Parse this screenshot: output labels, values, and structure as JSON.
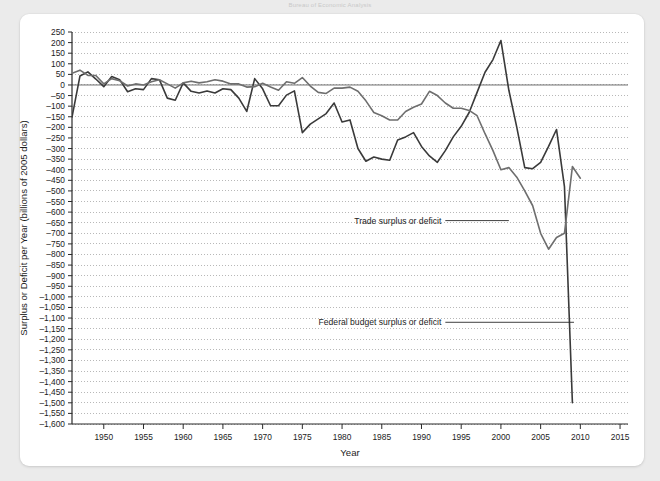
{
  "page": {
    "top_caption": "Bureau of Economic Analysis",
    "background_color": "#ebebeb",
    "card_color": "#ffffff"
  },
  "chart_data": {
    "type": "line",
    "title": "",
    "xlabel": "Year",
    "ylabel": "Surplus or Deficit per Year (billions of 2005 dollars)",
    "xlim": [
      1946,
      2016
    ],
    "ylim": [
      -1600,
      250
    ],
    "grid": true,
    "grid_style": "dotted-horizontal",
    "legend_position": "inline-annotation",
    "xticks": [
      1950,
      1955,
      1960,
      1965,
      1970,
      1975,
      1980,
      1985,
      1990,
      1995,
      2000,
      2005,
      2010,
      2015
    ],
    "xtick_labels": [
      "1950",
      "1955",
      "1960",
      "1965",
      "1970",
      "1975",
      "1980",
      "1985",
      "1990",
      "1995",
      "2000",
      "2005",
      "2010",
      "2015"
    ],
    "yticks": [
      250,
      200,
      150,
      100,
      50,
      0,
      -50,
      -100,
      -150,
      -200,
      -250,
      -300,
      -350,
      -400,
      -450,
      -500,
      -550,
      -600,
      -650,
      -700,
      -750,
      -800,
      -850,
      -900,
      -950,
      -1000,
      -1050,
      -1100,
      -1150,
      -1200,
      -1250,
      -1300,
      -1350,
      -1400,
      -1450,
      -1500,
      -1550,
      -1600
    ],
    "ytick_labels": [
      "250",
      "200",
      "150",
      "100",
      "50",
      "0",
      "–50",
      "–100",
      "–150",
      "–200",
      "–250",
      "–300",
      "–350",
      "–400",
      "–450",
      "–500",
      "–550",
      "–600",
      "–650",
      "–700",
      "–750",
      "–800",
      "–850",
      "–900",
      "–950",
      "–1,000",
      "–1,050",
      "–1,100",
      "–1,150",
      "–1,200",
      "–1,250",
      "–1,300",
      "–1,350",
      "–1,400",
      "–1,450",
      "–1,500",
      "–1,550",
      "–1,600"
    ],
    "annotations": [
      {
        "text": "Trade surplus or deficit",
        "x": 1992.5,
        "y": -640,
        "leader_to_x": 2001.0
      },
      {
        "text": "Federal budget surplus or deficit",
        "x": 1992.5,
        "y": -1120,
        "leader_to_x": 2009.2
      }
    ],
    "series": [
      {
        "name": "Federal budget surplus or deficit",
        "color": "#3a3a3a",
        "width": 1.6,
        "x": [
          1946,
          1947,
          1948,
          1949,
          1950,
          1951,
          1952,
          1953,
          1954,
          1955,
          1956,
          1957,
          1958,
          1959,
          1960,
          1961,
          1962,
          1963,
          1964,
          1965,
          1966,
          1967,
          1968,
          1969,
          1970,
          1971,
          1972,
          1973,
          1974,
          1975,
          1976,
          1977,
          1978,
          1979,
          1980,
          1981,
          1982,
          1983,
          1984,
          1985,
          1986,
          1987,
          1988,
          1989,
          1990,
          1991,
          1992,
          1993,
          1994,
          1995,
          1996,
          1997,
          1998,
          1999,
          2000,
          2001,
          2002,
          2003,
          2004,
          2005,
          2006,
          2007,
          2008,
          2009
        ],
        "values": [
          -152,
          42,
          62,
          28,
          -8,
          40,
          25,
          -32,
          -18,
          -22,
          30,
          25,
          -62,
          -72,
          10,
          -30,
          -38,
          -28,
          -38,
          -18,
          -22,
          -62,
          -125,
          30,
          -18,
          -98,
          -98,
          -48,
          -28,
          -225,
          -185,
          -160,
          -135,
          -85,
          -175,
          -165,
          -300,
          -360,
          -340,
          -350,
          -355,
          -260,
          -245,
          -225,
          -290,
          -335,
          -365,
          -310,
          -245,
          -195,
          -130,
          -35,
          60,
          120,
          210,
          -25,
          -200,
          -390,
          -395,
          -365,
          -290,
          -210,
          -480,
          -1500
        ]
      },
      {
        "name": "Trade surplus or deficit",
        "color": "#6e6e6e",
        "width": 1.6,
        "x": [
          1946,
          1947,
          1948,
          1949,
          1950,
          1951,
          1952,
          1953,
          1954,
          1955,
          1956,
          1957,
          1958,
          1959,
          1960,
          1961,
          1962,
          1963,
          1964,
          1965,
          1966,
          1967,
          1968,
          1969,
          1970,
          1971,
          1972,
          1973,
          1974,
          1975,
          1976,
          1977,
          1978,
          1979,
          1980,
          1981,
          1982,
          1983,
          1984,
          1985,
          1986,
          1987,
          1988,
          1989,
          1990,
          1991,
          1992,
          1993,
          1994,
          1995,
          1996,
          1997,
          1998,
          1999,
          2000,
          2001,
          2002,
          2003,
          2004,
          2005,
          2006,
          2007,
          2008,
          2009,
          2010
        ],
        "values": [
          55,
          70,
          45,
          45,
          5,
          30,
          20,
          -5,
          5,
          0,
          15,
          25,
          5,
          -15,
          10,
          18,
          10,
          15,
          25,
          18,
          5,
          5,
          -10,
          -8,
          8,
          -10,
          -25,
          15,
          8,
          35,
          -5,
          -35,
          -40,
          -15,
          -15,
          -10,
          -30,
          -75,
          -130,
          -145,
          -165,
          -165,
          -125,
          -105,
          -90,
          -30,
          -50,
          -85,
          -110,
          -110,
          -120,
          -145,
          -230,
          -310,
          -400,
          -390,
          -435,
          -500,
          -570,
          -700,
          -775,
          -720,
          -700,
          -385,
          -440
        ]
      }
    ]
  }
}
